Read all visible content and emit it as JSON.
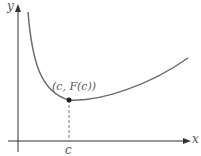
{
  "figure": {
    "y_axis_label": "y",
    "x_axis_label": "x",
    "point_label": "(c, F(c))",
    "tick_label": "c",
    "colors": {
      "curve": "#6b6b6b",
      "axis": "#333333",
      "point": "#222222",
      "dashed": "#777777"
    }
  }
}
